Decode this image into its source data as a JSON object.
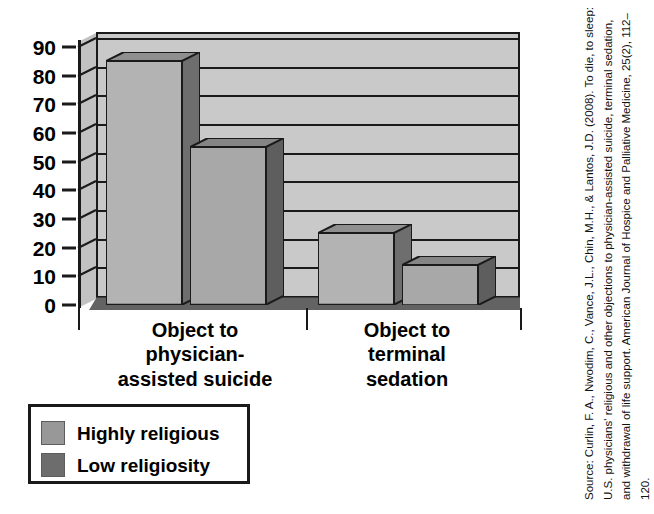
{
  "chart_data": {
    "type": "bar",
    "title": "",
    "subtitle": "",
    "xlabel": "",
    "ylabel": "",
    "ylim": [
      0,
      90
    ],
    "yticks": [
      90,
      80,
      70,
      60,
      50,
      40,
      30,
      20,
      10,
      0
    ],
    "grid": true,
    "three_d": true,
    "legend_position": "bottom-left",
    "categories": [
      "Object to physician-assisted suicide",
      "Object to terminal sedation"
    ],
    "category_lines": [
      [
        "Object to",
        "physician-",
        "assisted suicide"
      ],
      [
        "Object to",
        "terminal",
        "sedation"
      ]
    ],
    "series": [
      {
        "name": "Highly religious",
        "values": [
          85,
          25
        ],
        "color": "#b3b3b3",
        "side_color": "#6e6e6e",
        "top_color": "#8f8f8f"
      },
      {
        "name": "Low religiosity",
        "values": [
          55,
          14
        ],
        "color": "#a8a8a8",
        "side_color": "#5e5e5e",
        "top_color": "#858585"
      }
    ]
  },
  "legend": {
    "items": [
      {
        "label": "Highly religious",
        "color": "#989898"
      },
      {
        "label": "Low religiosity",
        "color": "#6d6d6d"
      }
    ]
  },
  "source": {
    "text": "Source: Curlin, F. A., Nwodim, C., Vance, J.L., Chin, M.H., & Lantos, J.D. (2008). To die, to sleep: U.S. physicians' religious and other objections to physician-assisted suicide, terminal sedation, and withdrawal of life support. American Journal of Hospice and Palliative Medicine, 25(2), 112–120."
  },
  "colors": {
    "plot_background": "#c9c9c9",
    "axis": "#1a1a1a",
    "page_background": "#ffffff"
  }
}
